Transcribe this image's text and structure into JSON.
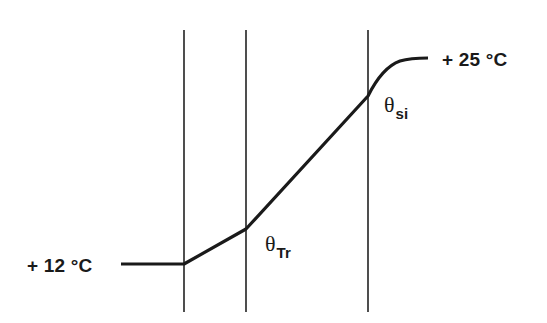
{
  "diagram": {
    "type": "temperature-profile-through-wall-layers",
    "colors": {
      "background": "#ffffff",
      "lines": "#1a1a1a"
    },
    "labels": {
      "inside_temp": "+ 25 °C",
      "outside_temp": "+ 12 °C",
      "theta_si": {
        "symbol": "θ",
        "subscript": "si"
      },
      "theta_tr": {
        "symbol": "θ",
        "subscript": "Tr"
      }
    },
    "layer_boundaries_x": [
      184,
      246,
      368
    ],
    "profile_points": [
      {
        "x": 121,
        "y": 264,
        "note": "outside air +12 °C"
      },
      {
        "x": 184,
        "y": 264,
        "note": "outer surface"
      },
      {
        "x": 246,
        "y": 229,
        "note": "θTr interface"
      },
      {
        "x": 368,
        "y": 96,
        "note": "θsi inner surface"
      },
      {
        "x": 428,
        "y": 58,
        "note": "inside air +25 °C"
      }
    ]
  }
}
